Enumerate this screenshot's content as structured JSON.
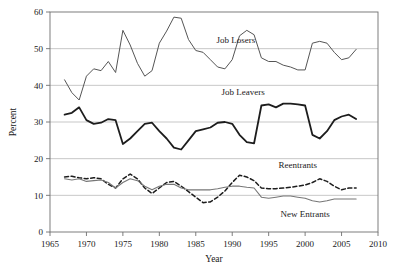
{
  "chart_data": {
    "type": "line",
    "title": "",
    "xlabel": "Year",
    "ylabel": "Percent",
    "xlim": [
      1965,
      2010
    ],
    "ylim": [
      0,
      60
    ],
    "xticks": [
      1965,
      1970,
      1975,
      1980,
      1985,
      1990,
      1995,
      2000,
      2005,
      2010
    ],
    "yticks": [
      0,
      10,
      20,
      30,
      40,
      50,
      60
    ],
    "grid": "horizontal",
    "legend_position": "inline-annotations",
    "x": [
      1967,
      1968,
      1969,
      1970,
      1971,
      1972,
      1973,
      1974,
      1975,
      1976,
      1977,
      1978,
      1979,
      1980,
      1981,
      1982,
      1983,
      1984,
      1985,
      1986,
      1987,
      1988,
      1989,
      1990,
      1991,
      1992,
      1993,
      1994,
      1995,
      1996,
      1997,
      1998,
      1999,
      2000,
      2001,
      2002,
      2003,
      2004,
      2005,
      2006,
      2007
    ],
    "series": [
      {
        "name": "Job Losers",
        "style": "solid-thin",
        "color": "#555555",
        "values": [
          41.5,
          38.0,
          36.0,
          42.5,
          44.5,
          44.0,
          46.5,
          43.5,
          55.0,
          51.0,
          46.0,
          42.5,
          44.0,
          51.5,
          54.8,
          58.6,
          58.3,
          52.5,
          49.5,
          49.0,
          47.0,
          45.0,
          44.5,
          47.0,
          53.5,
          55.0,
          53.8,
          47.5,
          46.5,
          46.5,
          45.5,
          45.0,
          44.2,
          44.2,
          51.5,
          52.0,
          51.5,
          49.0,
          47.0,
          47.5,
          49.8
        ]
      },
      {
        "name": "Job Leavers",
        "style": "solid-thick",
        "color": "#1d1d1d",
        "values": [
          32.0,
          32.5,
          34.0,
          30.5,
          29.5,
          29.8,
          30.8,
          30.5,
          24.0,
          25.5,
          27.5,
          29.5,
          29.8,
          27.5,
          25.5,
          23.0,
          22.5,
          25.0,
          27.5,
          28.0,
          28.5,
          29.8,
          30.0,
          29.5,
          26.5,
          24.5,
          24.2,
          34.5,
          34.8,
          34.0,
          35.0,
          35.0,
          34.8,
          34.5,
          26.5,
          25.5,
          27.5,
          30.5,
          31.5,
          32.0,
          30.8
        ]
      },
      {
        "name": "Reentrants",
        "style": "dashed",
        "color": "#1d1d1d",
        "values": [
          15.0,
          15.2,
          14.8,
          14.5,
          14.8,
          14.5,
          13.0,
          12.0,
          14.5,
          15.8,
          14.5,
          12.0,
          10.5,
          12.0,
          13.5,
          13.8,
          12.5,
          11.0,
          9.5,
          8.0,
          8.2,
          9.5,
          11.2,
          13.5,
          15.5,
          15.0,
          14.0,
          12.0,
          11.8,
          11.8,
          12.0,
          12.2,
          12.5,
          12.8,
          13.5,
          14.5,
          13.8,
          12.5,
          11.5,
          12.0,
          12.0
        ]
      },
      {
        "name": "New Entrants",
        "style": "solid-thin-gray",
        "color": "#777777",
        "values": [
          14.5,
          14.2,
          14.5,
          13.8,
          14.0,
          14.2,
          13.5,
          12.0,
          13.5,
          14.5,
          14.0,
          12.5,
          11.5,
          12.5,
          13.0,
          13.0,
          12.0,
          11.5,
          11.5,
          11.5,
          11.5,
          11.8,
          12.2,
          12.5,
          12.5,
          12.2,
          12.0,
          9.5,
          9.2,
          9.5,
          9.8,
          9.8,
          9.5,
          9.2,
          8.5,
          8.2,
          8.5,
          9.0,
          9.0,
          9.0,
          9.0
        ]
      }
    ],
    "annotations": [
      {
        "text": "Job Losers",
        "x": 1990.5,
        "y": 51.5
      },
      {
        "text": "Job Leavers",
        "x": 1991.5,
        "y": 37.5
      },
      {
        "text": "Reentrants",
        "x": 1999.0,
        "y": 17.5
      },
      {
        "text": "New Entrants",
        "x": 2000.0,
        "y": 4.0
      }
    ]
  },
  "axis": {
    "ylabel": "Percent",
    "xlabel": "Year",
    "yticklabels": [
      "0",
      "10",
      "20",
      "30",
      "40",
      "50",
      "60"
    ],
    "xticklabels": [
      "1965",
      "1970",
      "1975",
      "1980",
      "1985",
      "1990",
      "1995",
      "2000",
      "2005",
      "2010"
    ]
  }
}
